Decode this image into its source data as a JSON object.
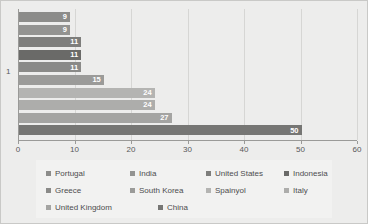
{
  "chart_data": {
    "type": "bar",
    "orientation": "horizontal",
    "title": "",
    "xlabel": "",
    "ylabel": "",
    "xlim": [
      0,
      60
    ],
    "ylim": [
      0,
      1
    ],
    "grid": true,
    "legend_position": "bottom",
    "y_category_label": "1",
    "x_ticks": [
      "0",
      "10",
      "20",
      "30",
      "40",
      "50",
      "60"
    ],
    "x_tick_values": [
      0,
      10,
      20,
      30,
      40,
      50,
      60
    ],
    "categories": [
      "Portugal",
      "India",
      "United States",
      "Indonesia",
      "Greece",
      "South Korea",
      "Spainyol",
      "Italy",
      "United Kingdom",
      "China"
    ],
    "values": [
      9,
      9,
      11,
      11,
      11,
      15,
      24,
      24,
      27,
      50
    ],
    "value_labels": [
      "9",
      "9",
      "11",
      "11",
      "11",
      "15",
      "24",
      "24",
      "27",
      "50"
    ],
    "bar_colors": [
      "#8c8c8a",
      "#939391",
      "#7e7e7c",
      "#6a6a68",
      "#8a8a88",
      "#9b9b99",
      "#b4b4b2",
      "#adadab",
      "#a4a4a2",
      "#767674"
    ],
    "series": [
      {
        "name": "Portugal",
        "value": 9,
        "color": "#8c8c8a"
      },
      {
        "name": "India",
        "value": 9,
        "color": "#939391"
      },
      {
        "name": "United States",
        "value": 11,
        "color": "#7e7e7c"
      },
      {
        "name": "Indonesia",
        "value": 11,
        "color": "#6a6a68"
      },
      {
        "name": "Greece",
        "value": 11,
        "color": "#8a8a88"
      },
      {
        "name": "South Korea",
        "value": 15,
        "color": "#9b9b99"
      },
      {
        "name": "Spainyol",
        "value": 24,
        "color": "#b4b4b2"
      },
      {
        "name": "Italy",
        "value": 24,
        "color": "#adadab"
      },
      {
        "name": "United Kingdom",
        "value": 27,
        "color": "#a4a4a2"
      },
      {
        "name": "China",
        "value": 50,
        "color": "#767674"
      }
    ]
  },
  "legend": {
    "rows": [
      [
        {
          "label": "Portugal",
          "color": "#8c8c8a"
        },
        {
          "label": "India",
          "color": "#939391"
        },
        {
          "label": "United States",
          "color": "#7e7e7c"
        },
        {
          "label": "Indonesia",
          "color": "#6a6a68"
        }
      ],
      [
        {
          "label": "Greece",
          "color": "#8a8a88"
        },
        {
          "label": "South Korea",
          "color": "#9b9b99"
        },
        {
          "label": "Spainyol",
          "color": "#b4b4b2"
        },
        {
          "label": "Italy",
          "color": "#adadab"
        }
      ],
      [
        {
          "label": "United Kingdom",
          "color": "#a4a4a2"
        },
        {
          "label": "China",
          "color": "#767674"
        }
      ]
    ]
  },
  "style": {
    "background": "#ededec",
    "legend_background": "#f2f2f1",
    "axis_color": "#9a9a98",
    "gridline_color": "#d6d6d4",
    "tick_text_color": "#58585a",
    "value_text_color": "#ffffff"
  }
}
